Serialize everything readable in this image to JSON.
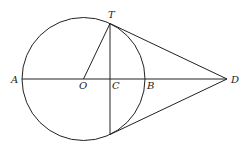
{
  "diagram": {
    "type": "geometry",
    "colors": {
      "stroke": "#222222",
      "background": "#ffffff"
    },
    "circle": {
      "center_label": "O",
      "cx": 83.5,
      "cy": 79,
      "r": 61.5
    },
    "points": [
      {
        "id": "A",
        "label": "A",
        "x": 22,
        "y": 79
      },
      {
        "id": "O",
        "label": "O",
        "x": 83.5,
        "y": 79
      },
      {
        "id": "C",
        "label": "C",
        "x": 110,
        "y": 79
      },
      {
        "id": "B",
        "label": "B",
        "x": 145,
        "y": 79
      },
      {
        "id": "D",
        "label": "D",
        "x": 227,
        "y": 79
      },
      {
        "id": "T",
        "label": "T",
        "x": 110,
        "y": 23.5
      },
      {
        "id": "T2",
        "label": "",
        "x": 110,
        "y": 134.5
      }
    ],
    "segments": [
      {
        "from": "A",
        "to": "D",
        "name": "line-AD"
      },
      {
        "from": "O",
        "to": "T",
        "name": "radius-OT"
      },
      {
        "from": "T",
        "to": "T2",
        "name": "chord-TT2"
      },
      {
        "from": "T",
        "to": "D",
        "name": "tangent-TD"
      },
      {
        "from": "T2",
        "to": "D",
        "name": "tangent-T2D"
      }
    ],
    "labels": {
      "A": "A",
      "O": "O",
      "C": "C",
      "B": "B",
      "D": "D",
      "T": "T"
    }
  }
}
